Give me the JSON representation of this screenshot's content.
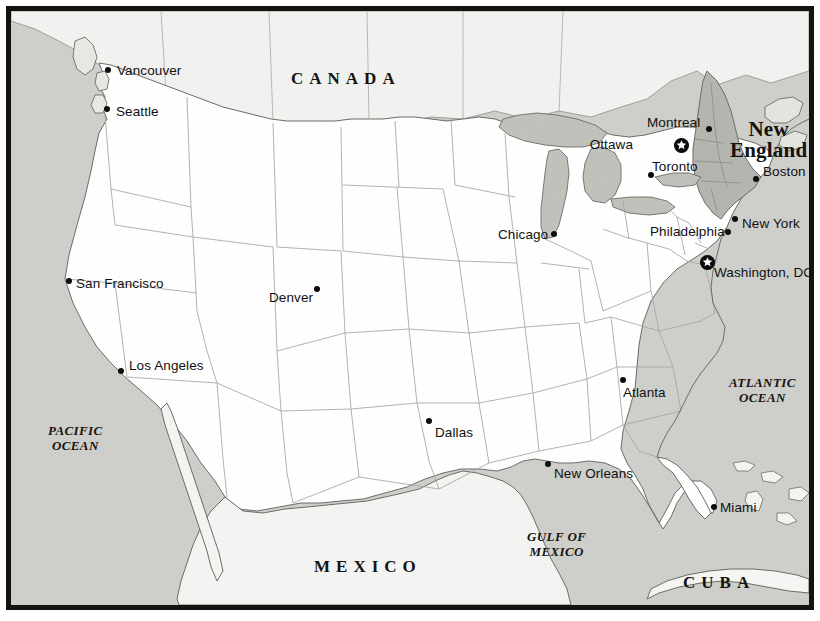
{
  "map": {
    "title_region": "New England",
    "frame_color": "#16130f",
    "land_color": "#ffffff",
    "water_color": "#cfcfcb",
    "highlight_color": "#b9b9b4",
    "border_color": "#9a9a96",
    "coast_color": "#6d6d68",
    "cities": [
      {
        "name": "Vancouver",
        "dot_x": 97,
        "dot_y": 59,
        "label_x": 106,
        "label_y": 52,
        "anchor": "left",
        "type": "city"
      },
      {
        "name": "Seattle",
        "dot_x": 96,
        "dot_y": 98,
        "label_x": 105,
        "label_y": 93,
        "anchor": "left",
        "type": "city"
      },
      {
        "name": "San Francisco",
        "dot_x": 58,
        "dot_y": 270,
        "label_x": 65,
        "label_y": 265,
        "anchor": "left",
        "type": "city"
      },
      {
        "name": "Los Angeles",
        "dot_x": 110,
        "dot_y": 360,
        "label_x": 118,
        "label_y": 347,
        "anchor": "left",
        "type": "city"
      },
      {
        "name": "Denver",
        "dot_x": 306,
        "dot_y": 278,
        "label_x": 258,
        "label_y": 279,
        "anchor": "left",
        "type": "city"
      },
      {
        "name": "Dallas",
        "dot_x": 418,
        "dot_y": 410,
        "label_x": 424,
        "label_y": 414,
        "anchor": "left",
        "type": "city"
      },
      {
        "name": "Chicago",
        "dot_x": 543,
        "dot_y": 223,
        "label_x": 487,
        "label_y": 216,
        "anchor": "left",
        "type": "city"
      },
      {
        "name": "New Orleans",
        "dot_x": 537,
        "dot_y": 453,
        "label_x": 543,
        "label_y": 455,
        "anchor": "left",
        "type": "city"
      },
      {
        "name": "Atlanta",
        "dot_x": 612,
        "dot_y": 369,
        "label_x": 612,
        "label_y": 374,
        "anchor": "left",
        "type": "city"
      },
      {
        "name": "Miami",
        "dot_x": 703,
        "dot_y": 496,
        "label_x": 709,
        "label_y": 489,
        "anchor": "left",
        "type": "city"
      },
      {
        "name": "Montreal",
        "dot_x": 698,
        "dot_y": 118,
        "label_x": 636,
        "label_y": 104,
        "anchor": "left",
        "type": "city"
      },
      {
        "name": "Toronto",
        "dot_x": 640,
        "dot_y": 164,
        "label_x": 641,
        "label_y": 148,
        "anchor": "left",
        "type": "city"
      },
      {
        "name": "Boston",
        "dot_x": 745,
        "dot_y": 168,
        "label_x": 752,
        "label_y": 153,
        "anchor": "left",
        "type": "city"
      },
      {
        "name": "New York",
        "dot_x": 724,
        "dot_y": 208,
        "label_x": 731,
        "label_y": 205,
        "anchor": "left",
        "type": "city"
      },
      {
        "name": "Philadelphia",
        "dot_x": 717,
        "dot_y": 221,
        "label_x": 639,
        "label_y": 213,
        "anchor": "left",
        "type": "city"
      }
    ],
    "capitals": [
      {
        "name": "Ottawa",
        "dot_x": 670,
        "dot_y": 134,
        "label_x": 622,
        "label_y": 126,
        "anchor": "right"
      },
      {
        "name": "Washington, DC",
        "dot_x": 696,
        "dot_y": 251,
        "label_x": 703,
        "label_y": 254,
        "anchor": "left"
      }
    ],
    "country_labels": [
      {
        "text": "CANADA",
        "x": 280,
        "y": 58,
        "letter_spacing": "6px"
      },
      {
        "text": "MEXICO",
        "x": 303,
        "y": 546,
        "letter_spacing": "6px"
      },
      {
        "text": "CUBA",
        "x": 672,
        "y": 562,
        "letter_spacing": "6px"
      }
    ],
    "ocean_labels": [
      {
        "line1": "PACIFIC",
        "line2": "OCEAN",
        "x": 37,
        "y": 413
      },
      {
        "line1": "ATLANTIC",
        "line2": "OCEAN",
        "x": 718,
        "y": 365
      },
      {
        "line1": "GULF OF",
        "line2": "MEXICO",
        "x": 516,
        "y": 519
      }
    ],
    "region_labels": [
      {
        "line1": "New",
        "line2": "England",
        "x": 719,
        "y": 108
      }
    ]
  }
}
